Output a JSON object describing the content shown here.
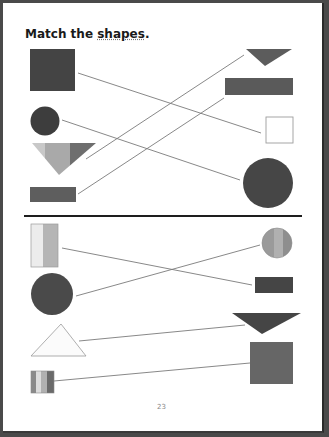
{
  "worksheet": {
    "title_prefix": "Match the ",
    "title_emphasis": "shapes",
    "title_suffix": ".",
    "page_number": "23"
  },
  "colors": {
    "dark": "#3d3d3d",
    "dark2": "#4a4a4a",
    "mid": "#5e5e5e",
    "mid2": "#6b6b6b",
    "light": "#a8a8a8",
    "lighter": "#c4c4c4",
    "pale": "#e8e8e8",
    "outline": "#999999",
    "line": "#7a7a7a",
    "divider": "#1e1e1e"
  },
  "sections": [
    {
      "name": "top",
      "left_shapes": [
        "square",
        "circle",
        "down-triangle",
        "rectangle"
      ],
      "right_shapes": [
        "down-triangle",
        "rectangle",
        "square",
        "circle"
      ],
      "matches": [
        {
          "left": "square",
          "right": "square"
        },
        {
          "left": "circle",
          "right": "circle"
        },
        {
          "left": "down-triangle",
          "right": "down-triangle"
        },
        {
          "left": "rectangle",
          "right": "rectangle"
        }
      ]
    },
    {
      "name": "bottom",
      "left_shapes": [
        "rectangle-vertical",
        "circle",
        "triangle",
        "square-small"
      ],
      "right_shapes": [
        "circle",
        "rectangle",
        "down-triangle",
        "square"
      ],
      "matches": [
        {
          "left": "rectangle-vertical",
          "right": "rectangle"
        },
        {
          "left": "circle",
          "right": "circle"
        },
        {
          "left": "triangle",
          "right": "down-triangle"
        },
        {
          "left": "square-small",
          "right": "square"
        }
      ]
    }
  ]
}
